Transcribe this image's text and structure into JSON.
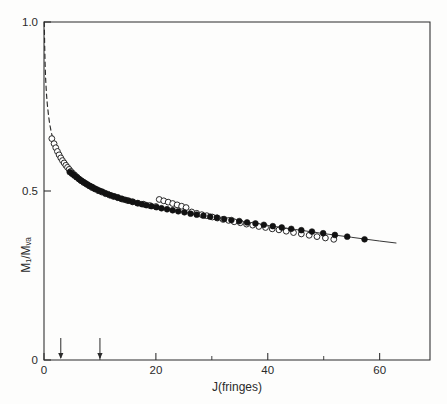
{
  "figure": {
    "background": "#fdfdfc",
    "ink_color": "#1d1d1d"
  },
  "chart_data": {
    "type": "scatter",
    "title": "",
    "xlabel": "J(fringes)",
    "ylabel": "M₁/Mᵥₐ",
    "ylabel_plain": "M1/Mwa",
    "xlim": [
      0,
      69
    ],
    "ylim": [
      0,
      1.0
    ],
    "xticks": [
      0,
      20,
      40,
      60
    ],
    "xticklabels": [
      "0",
      "20",
      "40",
      "60"
    ],
    "xticks_minor": [
      10,
      30,
      50
    ],
    "yticks": [
      0,
      0.5,
      1.0
    ],
    "yticklabels": [
      "0",
      "0.5",
      "1.0"
    ],
    "grid": false,
    "legend": null,
    "annotations": [
      {
        "name": "arrow-marker-1",
        "x": 3.0,
        "label": ""
      },
      {
        "name": "arrow-marker-2",
        "x": 10.0,
        "label": ""
      }
    ],
    "series": [
      {
        "name": "open-circles",
        "marker": "open-circle",
        "fill": "#ffffff",
        "stroke": "#1d1d1d",
        "points": [
          [
            1.4,
            0.655
          ],
          [
            1.8,
            0.64
          ],
          [
            2.1,
            0.628
          ],
          [
            2.4,
            0.617
          ],
          [
            2.7,
            0.607
          ],
          [
            3.0,
            0.598
          ],
          [
            3.3,
            0.59
          ],
          [
            3.6,
            0.583
          ],
          [
            3.9,
            0.576
          ],
          [
            4.2,
            0.57
          ],
          [
            4.5,
            0.564
          ],
          [
            4.8,
            0.558
          ],
          [
            5.1,
            0.553
          ],
          [
            5.5,
            0.547
          ],
          [
            5.9,
            0.541
          ],
          [
            6.3,
            0.535
          ],
          [
            6.7,
            0.53
          ],
          [
            7.1,
            0.525
          ],
          [
            7.6,
            0.52
          ],
          [
            8.1,
            0.515
          ],
          [
            8.6,
            0.51
          ],
          [
            9.1,
            0.506
          ],
          [
            9.7,
            0.501
          ],
          [
            10.3,
            0.497
          ],
          [
            11.0,
            0.492
          ],
          [
            11.7,
            0.488
          ],
          [
            12.4,
            0.484
          ],
          [
            13.2,
            0.48
          ],
          [
            14.0,
            0.476
          ],
          [
            14.9,
            0.472
          ],
          [
            15.8,
            0.468
          ],
          [
            16.8,
            0.464
          ],
          [
            17.8,
            0.461
          ],
          [
            18.9,
            0.457
          ],
          [
            20.0,
            0.454
          ],
          [
            20.6,
            0.475
          ],
          [
            21.4,
            0.471
          ],
          [
            22.2,
            0.467
          ],
          [
            23.0,
            0.463
          ],
          [
            23.8,
            0.459
          ],
          [
            24.6,
            0.455
          ],
          [
            25.4,
            0.451
          ],
          [
            26.4,
            0.438
          ],
          [
            27.3,
            0.434
          ],
          [
            28.2,
            0.43
          ],
          [
            29.1,
            0.427
          ],
          [
            30.1,
            0.423
          ],
          [
            31.0,
            0.42
          ],
          [
            32.0,
            0.416
          ],
          [
            33.0,
            0.413
          ],
          [
            34.0,
            0.409
          ],
          [
            35.1,
            0.406
          ],
          [
            36.2,
            0.402
          ],
          [
            37.3,
            0.399
          ],
          [
            38.4,
            0.395
          ],
          [
            39.6,
            0.392
          ],
          [
            40.8,
            0.388
          ],
          [
            42.0,
            0.385
          ],
          [
            43.3,
            0.381
          ],
          [
            44.6,
            0.377
          ],
          [
            46.0,
            0.373
          ],
          [
            47.4,
            0.369
          ],
          [
            48.8,
            0.365
          ],
          [
            50.3,
            0.361
          ],
          [
            51.8,
            0.357
          ]
        ]
      },
      {
        "name": "filled-circles",
        "marker": "filled-circle",
        "fill": "#121212",
        "stroke": "#121212",
        "points": [
          [
            4.6,
            0.556
          ],
          [
            5.0,
            0.551
          ],
          [
            5.4,
            0.546
          ],
          [
            5.8,
            0.541
          ],
          [
            6.2,
            0.536
          ],
          [
            6.6,
            0.531
          ],
          [
            7.0,
            0.527
          ],
          [
            7.4,
            0.523
          ],
          [
            7.8,
            0.519
          ],
          [
            8.2,
            0.515
          ],
          [
            8.6,
            0.512
          ],
          [
            9.0,
            0.508
          ],
          [
            9.4,
            0.505
          ],
          [
            9.9,
            0.501
          ],
          [
            10.4,
            0.498
          ],
          [
            10.9,
            0.494
          ],
          [
            11.4,
            0.491
          ],
          [
            12.0,
            0.487
          ],
          [
            12.6,
            0.484
          ],
          [
            13.2,
            0.481
          ],
          [
            13.8,
            0.477
          ],
          [
            14.5,
            0.474
          ],
          [
            15.2,
            0.471
          ],
          [
            15.9,
            0.468
          ],
          [
            16.7,
            0.464
          ],
          [
            17.5,
            0.461
          ],
          [
            18.3,
            0.458
          ],
          [
            19.2,
            0.455
          ],
          [
            20.1,
            0.452
          ],
          [
            21.0,
            0.449
          ],
          [
            22.0,
            0.446
          ],
          [
            23.0,
            0.443
          ],
          [
            24.0,
            0.44
          ],
          [
            25.1,
            0.437
          ],
          [
            26.2,
            0.433
          ],
          [
            27.3,
            0.43
          ],
          [
            28.5,
            0.427
          ],
          [
            29.7,
            0.424
          ],
          [
            30.9,
            0.421
          ],
          [
            32.2,
            0.417
          ],
          [
            33.5,
            0.414
          ],
          [
            34.9,
            0.411
          ],
          [
            36.3,
            0.407
          ],
          [
            37.8,
            0.404
          ],
          [
            39.3,
            0.4
          ],
          [
            40.9,
            0.396
          ],
          [
            42.5,
            0.392
          ],
          [
            44.2,
            0.388
          ],
          [
            46.0,
            0.384
          ],
          [
            47.9,
            0.38
          ],
          [
            49.9,
            0.375
          ],
          [
            52.0,
            0.37
          ],
          [
            54.2,
            0.365
          ],
          [
            57.3,
            0.357
          ]
        ]
      }
    ],
    "fit_line": {
      "name": "fit-curve",
      "style": "solid",
      "points": [
        [
          6.0,
          0.54
        ],
        [
          10.0,
          0.5
        ],
        [
          15.0,
          0.47
        ],
        [
          20.0,
          0.452
        ],
        [
          25.0,
          0.437
        ],
        [
          30.0,
          0.424
        ],
        [
          35.0,
          0.411
        ],
        [
          40.0,
          0.398
        ],
        [
          45.0,
          0.386
        ],
        [
          50.0,
          0.374
        ],
        [
          55.0,
          0.363
        ],
        [
          60.0,
          0.352
        ],
        [
          63.0,
          0.346
        ]
      ]
    },
    "dashed_curve": {
      "name": "extrapolated-curve",
      "style": "dashed",
      "points": [
        [
          0.05,
          1.0
        ],
        [
          0.12,
          0.93
        ],
        [
          0.2,
          0.875
        ],
        [
          0.3,
          0.83
        ],
        [
          0.45,
          0.785
        ],
        [
          0.6,
          0.755
        ],
        [
          0.8,
          0.725
        ],
        [
          1.0,
          0.7
        ],
        [
          1.25,
          0.678
        ],
        [
          1.5,
          0.66
        ],
        [
          1.8,
          0.642
        ],
        [
          2.2,
          0.624
        ],
        [
          2.6,
          0.61
        ],
        [
          3.0,
          0.598
        ],
        [
          3.6,
          0.583
        ],
        [
          4.2,
          0.57
        ],
        [
          5.0,
          0.555
        ],
        [
          6.0,
          0.54
        ]
      ]
    }
  }
}
